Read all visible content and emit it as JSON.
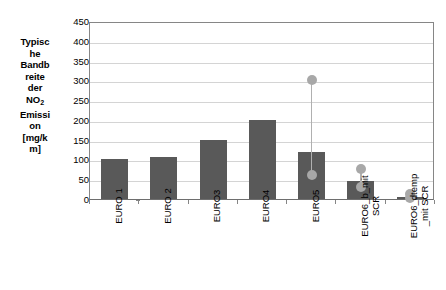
{
  "chart_data": {
    "type": "bar",
    "title": "",
    "subtitle": "",
    "xlabel": "",
    "ylabel": "Typische Bandbreite der NO2 Emission [mg/km]",
    "ylabel_lines": [
      "Typisc",
      "he",
      "Bandb",
      "reite",
      "der",
      "NO",
      "Emissi",
      "on",
      "[mg/k",
      "m]"
    ],
    "ylabel_subscript_line_index": 5,
    "ylabel_subscript": "2",
    "ylim": [
      0,
      450
    ],
    "ytick_step": 50,
    "yticks": [
      450,
      400,
      350,
      300,
      250,
      200,
      150,
      100,
      50,
      0
    ],
    "ytick_labels": [
      "450",
      "400",
      "350",
      "300",
      "250",
      "200",
      "150",
      "100",
      "50",
      "0"
    ],
    "grid": true,
    "grid_axis": "y",
    "legend": false,
    "legend_position": "none",
    "categories": [
      "EURO 1",
      "EURO 2",
      "EURO3",
      "EURO4",
      "EURO5",
      "EURO6_b_mit SCR",
      "EURO6_dtemp_mit SCR"
    ],
    "category_label_lines": [
      [
        "EURO 1"
      ],
      [
        "EURO 2"
      ],
      [
        "EURO3"
      ],
      [
        "EURO4"
      ],
      [
        "EURO5"
      ],
      [
        "EURO6_b_mit",
        "SCR"
      ],
      [
        "EURO6_dtemp",
        "_mit SCR"
      ]
    ],
    "series": [
      {
        "name": "Typische Bandbreite der NO2 Emission",
        "values": [
          100,
          105,
          148,
          200,
          120,
          45,
          5
        ]
      }
    ],
    "range_markers": [
      {
        "category": "EURO 1",
        "low": null,
        "high": null
      },
      {
        "category": "EURO 2",
        "low": null,
        "high": null
      },
      {
        "category": "EURO3",
        "low": null,
        "high": null
      },
      {
        "category": "EURO4",
        "low": null,
        "high": null
      },
      {
        "category": "EURO5",
        "low": 60,
        "high": 300
      },
      {
        "category": "EURO6_b_mit SCR",
        "low": 30,
        "high": 75
      },
      {
        "category": "EURO6_dtemp_mit SCR",
        "low": 2,
        "high": 12
      }
    ],
    "colors": {
      "bar_fill": "#595959",
      "marker": "#a8a8a8",
      "marker_line": "#b0b0b0",
      "gridline": "#d4d4d4",
      "axis": "#868686",
      "background": "#ffffff",
      "text": "#000000"
    }
  }
}
